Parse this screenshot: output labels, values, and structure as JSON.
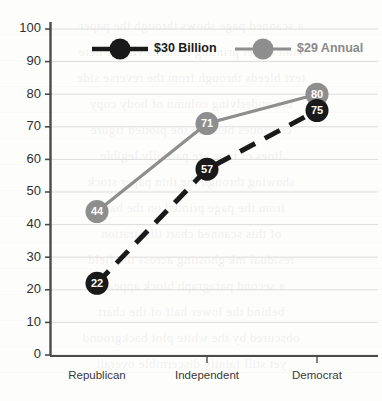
{
  "chart_data": {
    "type": "line",
    "title": "",
    "xlabel": "",
    "ylabel": "",
    "categories": [
      "Republican",
      "Independent",
      "Democrat"
    ],
    "ylim": [
      0,
      100
    ],
    "yticks": [
      0,
      10,
      20,
      30,
      40,
      50,
      60,
      70,
      80,
      90,
      100
    ],
    "ytick_labels": [
      "0",
      "10",
      "20",
      "30",
      "40",
      "50",
      "60",
      "70",
      "80",
      "90",
      "100"
    ],
    "grid": true,
    "grid_axis": "y",
    "legend_position": "top-center",
    "series": [
      {
        "name": "$30 Billion",
        "values": [
          22,
          57,
          75
        ],
        "color": "#1a1a1a",
        "linestyle": "dashed",
        "marker": "circle",
        "label_color": "#ffffff"
      },
      {
        "name": "$29 Annual",
        "values": [
          44,
          71,
          80
        ],
        "color": "#8e8e8e",
        "linestyle": "solid",
        "marker": "circle",
        "label_color": "#ffffff"
      }
    ]
  },
  "axes": {
    "y_axis_name": "y-axis",
    "x_axis_name": "x-axis"
  },
  "legend": {
    "items": [
      {
        "label": "$30 Billion",
        "color": "#1a1a1a",
        "text_color": "#1a1a1a"
      },
      {
        "label": "$29 Annual",
        "color": "#8e8e8e",
        "text_color": "#8a8a8a"
      }
    ]
  },
  "background": {
    "ghost_lines": [
      "a scanned page shows through the paper",
      "faint offset printing remains visible here",
      "text bleeds through from the reverse side",
      "the underlying column of body copy",
      "continues beneath the plotted figure",
      "lines of type are partially legible",
      "showing through the thin paper stock",
      "from the page printed on the back",
      "of this scanned chart illustration",
      "residual ink ghosting across the field",
      "a second paragraph block appears",
      "behind the lower half of the chart",
      "obscured by the white plot background",
      "yet still faintly discernible overall"
    ]
  },
  "colors": {
    "series_dark": "#1a1a1a",
    "series_gray": "#8e8e8e",
    "axis": "#4a4a4a",
    "grid": "#dcdcdc",
    "background": "#fdfdfc"
  }
}
